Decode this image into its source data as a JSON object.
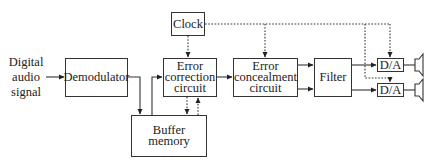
{
  "diagram": {
    "input_label": [
      "Digital",
      "audio",
      "signal"
    ],
    "blocks": {
      "clock": "Clock",
      "demodulator": "Demodulator",
      "error_correction": [
        "Error",
        "correction",
        "circuit"
      ],
      "buffer_memory": "Buffer memory",
      "error_concealment": [
        "Error",
        "concealment",
        "circuit"
      ],
      "filter": "Filter",
      "da_top": "D/A",
      "da_bottom": "D/A"
    },
    "outputs": [
      "speaker-left",
      "speaker-right"
    ],
    "line_styles": {
      "signal": "solid",
      "clock": "dotted"
    }
  }
}
